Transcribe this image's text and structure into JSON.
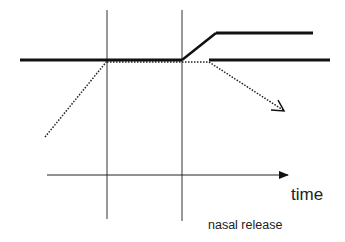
{
  "diagram": {
    "type": "timing-diagram",
    "labels": {
      "time_axis": "time",
      "event": "nasal release"
    },
    "colors": {
      "line": "#111111",
      "background": "#ffffff"
    },
    "elements": {
      "vertical_markers": [
        {
          "x": 107,
          "y1": 10,
          "y2": 219
        },
        {
          "x": 182,
          "y1": 10,
          "y2": 221
        }
      ],
      "baseline_solid_left": {
        "x1": 20,
        "y1": 60,
        "x2": 182,
        "y2": 60
      },
      "rise_solid": {
        "x1": 182,
        "y1": 60,
        "x2": 216,
        "y2": 33
      },
      "upper_solid": {
        "x1": 216,
        "y1": 33,
        "x2": 313,
        "y2": 33
      },
      "baseline_solid_right": {
        "x1": 209,
        "y1": 60,
        "x2": 330,
        "y2": 60
      },
      "dotted_rise_left": {
        "x1": 45,
        "y1": 137,
        "x2": 107,
        "y2": 61
      },
      "dotted_flat": {
        "x1": 107,
        "y1": 61,
        "x2": 209,
        "y2": 61
      },
      "dotted_fall_arrow": {
        "x1": 209,
        "y1": 61,
        "x2": 284,
        "y2": 111
      },
      "time_axis": {
        "x1": 47,
        "y1": 175,
        "x2": 288,
        "y2": 175
      }
    }
  }
}
